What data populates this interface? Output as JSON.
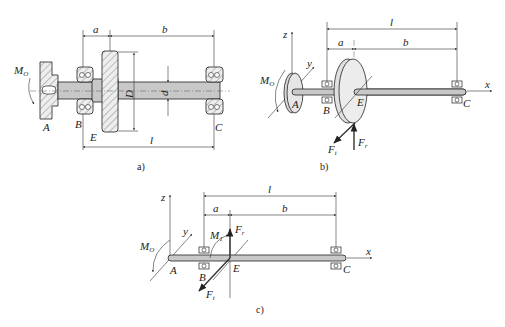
{
  "figure_a": {
    "caption": "a)",
    "labels": {
      "moment": "M",
      "moment_sub": "O",
      "A": "A",
      "B": "B",
      "C": "C",
      "E": "E",
      "a": "a",
      "b": "b",
      "l": "l",
      "D": "D",
      "d": "d"
    }
  },
  "figure_b": {
    "caption": "b)",
    "labels": {
      "moment": "M",
      "moment_sub": "O",
      "A": "A",
      "B": "B",
      "C": "C",
      "E": "E",
      "a": "a",
      "b": "b",
      "l": "l",
      "x": "x",
      "y": "y",
      "z": "z",
      "Ft": "F",
      "Ft_sub": "t",
      "Fr": "F",
      "Fr_sub": "r"
    }
  },
  "figure_c": {
    "caption": "c)",
    "labels": {
      "moment": "M",
      "moment_sub": "O",
      "M1": "M",
      "M1_sub": "1",
      "A": "A",
      "B": "B",
      "C": "C",
      "E": "E",
      "a": "a",
      "b": "b",
      "l": "l",
      "x": "x",
      "y": "y",
      "z": "z",
      "Ft": "F",
      "Ft_sub": "t",
      "Fr": "F",
      "Fr_sub": "r"
    }
  },
  "colors": {
    "line": "#222222",
    "shaft_fill": "#c8c8c8",
    "background": "#ffffff"
  }
}
